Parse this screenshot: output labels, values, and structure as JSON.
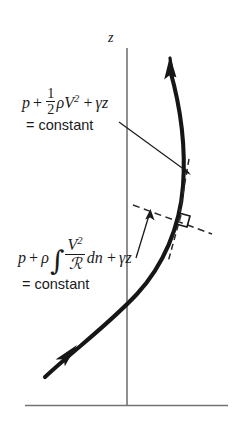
{
  "figure": {
    "background_color": "#ffffff",
    "ink_color": "#1a1a1a",
    "axis_color": "#6e6e70",
    "axis_label": "z",
    "streamline_arrow_count": 2,
    "baseline_label": ""
  },
  "equations": {
    "along_streamline": {
      "name": "bernoulli-along-streamline",
      "p": "p",
      "plus1": "+",
      "half_num": "1",
      "half_den": "2",
      "rho": "ρ",
      "V": "V",
      "V_exp": "2",
      "plus2": "+",
      "gamma": "γ",
      "z": "z",
      "result": "= constant"
    },
    "normal_to_streamline": {
      "name": "bernoulli-normal-to-streamline",
      "p": "p",
      "plus1": "+",
      "rho": "ρ",
      "integral": "∫",
      "V": "V",
      "V_exp": "2",
      "R": "ℛ",
      "dn": "dn",
      "plus2": "+",
      "gamma": "γ",
      "z": "z",
      "result": "= constant"
    }
  },
  "annotations": {
    "normal_direction_label": "",
    "right_angle_marker": "perpendicular",
    "leader_top_target": "streamline point upper",
    "leader_bottom_target": "streamline point lower"
  },
  "geometry": {
    "z_axis_x": 127,
    "z_axis_top_y": 48,
    "z_axis_bottom_y": 405,
    "baseline_y": 405,
    "baseline_x_start": 25,
    "baseline_x_end": 228,
    "streamline_start": [
      42,
      379
    ],
    "streamline_end": [
      180,
      57
    ]
  }
}
